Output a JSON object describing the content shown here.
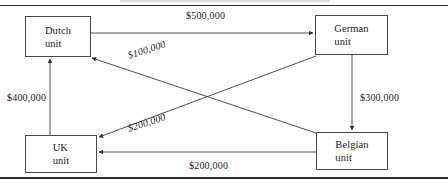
{
  "diagram": {
    "type": "network-flow",
    "nodes": [
      {
        "id": "dutch",
        "label_line1": "Dutch",
        "label_line2": "unit"
      },
      {
        "id": "german",
        "label_line1": "German",
        "label_line2": "unit"
      },
      {
        "id": "uk",
        "label_line1": "UK",
        "label_line2": "unit"
      },
      {
        "id": "belgian",
        "label_line1": "Belgian",
        "label_line2": "unit"
      }
    ],
    "edges": [
      {
        "id": "dutch-german",
        "from": "Dutch unit",
        "to": "German unit",
        "amount": "$500,000"
      },
      {
        "id": "belgian-dutch",
        "from": "Belgian unit",
        "to": "Dutch unit",
        "amount": "$100,000"
      },
      {
        "id": "german-uk",
        "from": "German unit",
        "to": "UK unit",
        "amount": "$200,000"
      },
      {
        "id": "uk-dutch",
        "from": "UK unit",
        "to": "Dutch unit",
        "amount": "$400,000"
      },
      {
        "id": "german-belgian",
        "from": "German unit",
        "to": "Belgian unit",
        "amount": "$300,000"
      },
      {
        "id": "belgian-uk",
        "from": "Belgian unit",
        "to": "UK unit",
        "amount": "$200,000"
      }
    ],
    "colors": {
      "line": "#3a3a3a",
      "box_border": "#4a4a4a",
      "text": "#1a1a1a",
      "background": "#ffffff",
      "rule": "#2b2b2b"
    }
  }
}
